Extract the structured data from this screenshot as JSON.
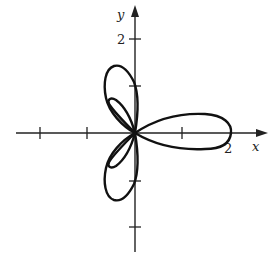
{
  "figure": {
    "type": "polar-curve",
    "axes": {
      "x_label": "x",
      "y_label": "y",
      "x_tick_label": "2",
      "y_tick_label": "2",
      "x_ticks": [
        -2,
        -1,
        1,
        2
      ],
      "y_ticks": [
        -2,
        -1,
        1,
        2
      ]
    },
    "colors": {
      "background": "#ffffff",
      "ink": "#111111"
    }
  }
}
